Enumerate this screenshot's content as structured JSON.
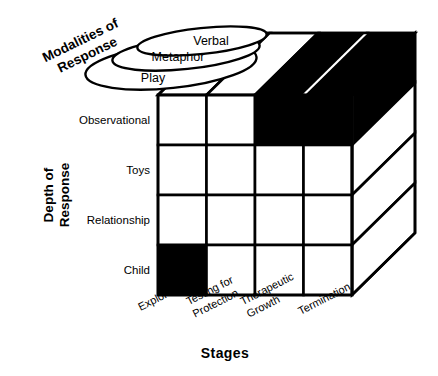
{
  "diagram": {
    "axes": {
      "x_axis_label": "Stages",
      "y_axis_label_line1": "Depth of",
      "y_axis_label_line2": "Response",
      "z_axis_label_line1": "Modalities of",
      "z_axis_label_line2": "Response"
    },
    "depth_of_response": {
      "label": "Depth of Response",
      "rows": [
        {
          "label": "Observational"
        },
        {
          "label": "Toys"
        },
        {
          "label": "Relationship"
        },
        {
          "label": "Child"
        }
      ]
    },
    "modalities_of_response": {
      "label": "Modalities of Response",
      "items": [
        {
          "label": "Verbal"
        },
        {
          "label": "Metaphor"
        },
        {
          "label": "Play"
        }
      ]
    },
    "stages": {
      "label": "Stages",
      "items": [
        {
          "line1": "Exploratory",
          "line2": ""
        },
        {
          "line1": "Testing for",
          "line2": "Protection"
        },
        {
          "line1": "Therapeutic",
          "line2": "Growth"
        },
        {
          "line1": "Termination",
          "line2": ""
        }
      ]
    },
    "highlighted_cells": {
      "front_face": [
        {
          "row": "Observational",
          "stage": "Therapeutic Growth",
          "fill": "#000000"
        },
        {
          "row": "Observational",
          "stage": "Termination",
          "fill": "#000000"
        },
        {
          "row": "Child",
          "stage": "Exploratory",
          "fill": "#000000"
        }
      ],
      "top_face": [
        {
          "stage": "Therapeutic Growth",
          "fill": "#000000"
        },
        {
          "stage": "Termination",
          "fill": "#000000"
        }
      ],
      "right_face": [
        {
          "row": "Observational",
          "fill": "#000000"
        }
      ]
    },
    "colors": {
      "stroke": "#000000",
      "fill_empty": "#ffffff",
      "fill_highlight": "#000000",
      "background": "#ffffff"
    }
  }
}
